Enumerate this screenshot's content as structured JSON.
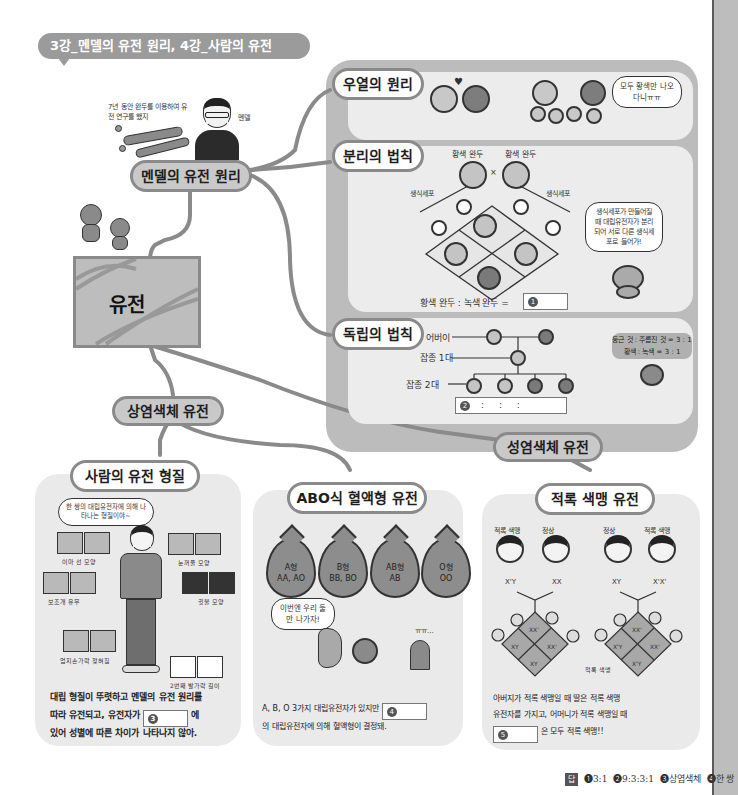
{
  "title": "3강_멘델의 유전 원리, 4강_사람의 유전",
  "center_node": "유전",
  "mendel": {
    "node_label": "멘델의 유전 원리",
    "caption": "7년 동안 완두를 이용하여 유전 연구를 했지",
    "person_label": "멘델"
  },
  "right_panel": {
    "dominance": {
      "label": "우열의 원리",
      "speech": "모두 황색만 나오다니ㅠㅠ"
    },
    "segregation": {
      "label": "분리의 법칙",
      "parent_left": "황색 완두",
      "parent_right": "황색 완두",
      "cross_symbol": "×",
      "gamete_left": "생식세포",
      "gamete_right": "생식세포",
      "speech": "생식세포가 만들어질 때 대립유전자가 분리되어 서로 다른 생식세포로 들어가!",
      "ratio_text": "황색 완두 : 녹색 완두 =",
      "answer_num": "1"
    },
    "independent": {
      "label": "독립의 법칙",
      "gen_parent": "어버이",
      "gen_f1": "잡종 1대",
      "gen_f2": "잡종 2대",
      "note_line1": "둥근 것 : 주름진 것 = 3 : 1",
      "note_line2": "황색 : 녹색 = 3 : 1",
      "answer_num": "2",
      "answer_template": ":      :      :"
    }
  },
  "autosomal": {
    "node_label": "상염색체 유전",
    "human_traits": {
      "label": "사람의 유전 형질",
      "speech": "한 쌍의 대립유전자에 의해 나타나는 형질이야~",
      "traits": [
        "이마 선 모양",
        "보조개 유무",
        "엄지손가락 젖혀짐",
        "눈꺼풀 모양",
        "귓불 모양",
        "2번째 발가락 길이"
      ],
      "text_line1": "대립 형질이 뚜렷하고 멘델의 유전 원리를",
      "text_line2_a": "따라 유전되고, 유전자가",
      "text_line2_b": "에",
      "text_line3": "있어 성별에 따른 차이가 나타나지 않아.",
      "answer_num": "3"
    },
    "abo": {
      "label": "ABO식 혈액형 유전",
      "drops": [
        {
          "type": "A형",
          "genotype": "AA, AO"
        },
        {
          "type": "B형",
          "genotype": "BB, BO"
        },
        {
          "type": "AB형",
          "genotype": "AB"
        },
        {
          "type": "O형",
          "genotype": "OO"
        }
      ],
      "speech": "이번엔 우리 둘만 나가자!",
      "sad_text": "ㅠㅠ...",
      "text_line1_a": "A, B, O 3가지 대립유전자가 있지만",
      "text_line2": "의 대립유전자에 의해 혈액형이 결정돼.",
      "answer_num": "4"
    }
  },
  "sex_linked": {
    "node_label": "성염색체 유전",
    "colorblind": {
      "label": "적록 색맹 유전",
      "people": [
        {
          "label": "적록 색맹",
          "genotype": "X'Y"
        },
        {
          "label": "정상",
          "genotype": "XX"
        },
        {
          "label": "정상",
          "genotype": "XY"
        },
        {
          "label": "적록 색맹",
          "genotype": "X'X'"
        }
      ],
      "left_punnett": {
        "sperm": [
          "X'",
          "Y"
        ],
        "egg": [
          "X",
          "X"
        ],
        "cells": [
          "XX'",
          "XY",
          "XX'",
          "XY"
        ]
      },
      "right_punnett": {
        "sperm": [
          "X",
          "Y"
        ],
        "egg": [
          "X'",
          "X'"
        ],
        "cells": [
          "XX'",
          "X'Y",
          "XX'",
          "X'Y"
        ]
      },
      "right_caption": "적록 색맹",
      "text_line1": "아버지가 적록 색맹일 때 딸은 적록 색맹",
      "text_line2": "유전자를 가지고, 어머니가 적록 색맹일 때",
      "text_line3_b": "은 모두 적록 색맹!!",
      "answer_num": "5"
    }
  },
  "footer": {
    "tag": "답",
    "answers": [
      "❶3:1",
      "❷9:3:3:1",
      "❸상염색체",
      "❹한 쌍",
      "❺아들"
    ]
  },
  "colors": {
    "panel_grey": "#bcbcbc",
    "section_bg": "#ececec",
    "line_grey": "#8a8a8a",
    "title_bg": "#9b9b9b"
  }
}
